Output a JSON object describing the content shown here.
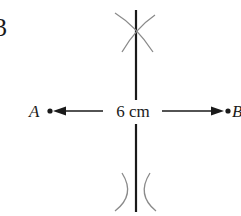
{
  "question_number": "3",
  "diagram": {
    "type": "perpendicular-bisector-construction",
    "points": [
      {
        "name": "A",
        "label": "A"
      },
      {
        "name": "B",
        "label": "B"
      }
    ],
    "segment_length_label": "6 cm",
    "colors": {
      "line": "#1a1a1a",
      "arc": "#8a8a8a"
    }
  }
}
